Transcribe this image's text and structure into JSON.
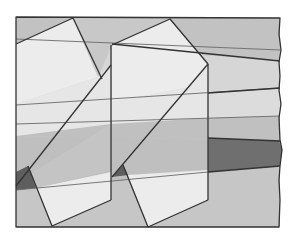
{
  "diagram": {
    "type": "geometric-illustration",
    "colors": {
      "background": "#ffffff",
      "frame_top_band": "#c6c6c6",
      "upper_band": "#d4d4d4",
      "mid_band": "#bdbdbd",
      "lower_band": "#c4c4c4",
      "dark_band": "#6f6f6f",
      "light_shape": "#ececec",
      "dark_triangle": "#5e5e5e",
      "edge": "#333333"
    },
    "frame": {
      "x": 16,
      "y": 17,
      "width": 264,
      "height": 210,
      "right_edge_style": "torn"
    },
    "shapes": [
      {
        "name": "left-upper-quad",
        "points": [
          [
            16,
            44
          ],
          [
            73,
            18
          ],
          [
            98,
            77
          ],
          [
            16,
            104
          ]
        ]
      },
      {
        "name": "right-upper-quad",
        "points": [
          [
            112,
            45
          ],
          [
            170,
            19
          ],
          [
            208,
            64
          ],
          [
            112,
            102
          ]
        ]
      },
      {
        "name": "left-slanted-parallelogram",
        "points": [
          [
            16,
            186
          ],
          [
            98,
            77
          ],
          [
            111,
            65
          ],
          [
            111,
            200
          ],
          [
            52,
            226
          ],
          [
            30,
            174
          ]
        ]
      },
      {
        "name": "right-slanted-parallelogram",
        "points": [
          [
            112,
            177
          ],
          [
            190,
            87
          ],
          [
            208,
            64
          ],
          [
            208,
            200
          ],
          [
            148,
            227
          ],
          [
            128,
            175
          ]
        ]
      },
      {
        "name": "left-dark-triangle",
        "points": [
          [
            16,
            172
          ],
          [
            28,
            166
          ],
          [
            36,
            188
          ],
          [
            16,
            190
          ]
        ]
      },
      {
        "name": "right-dark-triangle",
        "points": [
          [
            112,
            177
          ],
          [
            123,
            165
          ],
          [
            128,
            175
          ]
        ]
      },
      {
        "name": "dark-band-right",
        "points": [
          [
            208,
            138
          ],
          [
            280,
            141
          ],
          [
            280,
            167
          ],
          [
            208,
            172
          ]
        ]
      }
    ]
  }
}
